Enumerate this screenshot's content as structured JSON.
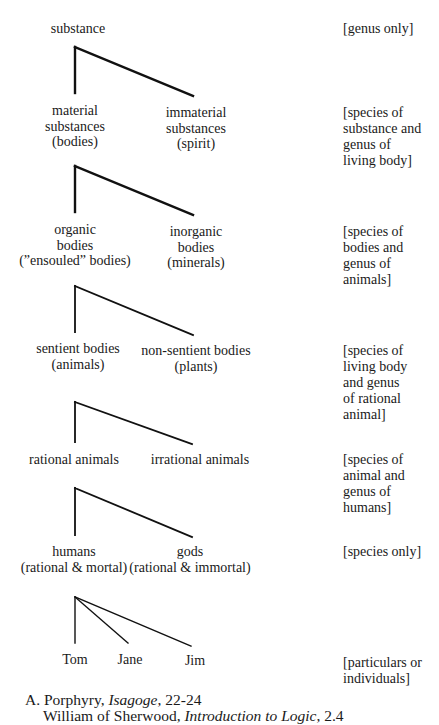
{
  "diagram": {
    "line_color": "#111111",
    "levels": [
      {
        "left": {
          "lines": [
            "substance"
          ]
        },
        "right": null,
        "note": [
          "[genus only]"
        ]
      },
      {
        "left": {
          "lines": [
            "material",
            "substances",
            "(bodies)"
          ]
        },
        "right": {
          "lines": [
            "immaterial",
            "substances",
            "(spirit)"
          ]
        },
        "note": [
          "[species of",
          "substance and",
          "genus of",
          "living body]"
        ]
      },
      {
        "left": {
          "lines": [
            "organic",
            "bodies",
            "(”ensouled” bodies)"
          ]
        },
        "right": {
          "lines": [
            "inorganic",
            "bodies",
            "(minerals)"
          ]
        },
        "note": [
          "[species of",
          "bodies and",
          "genus of",
          "animals]"
        ]
      },
      {
        "left": {
          "lines": [
            "sentient bodies",
            "(animals)"
          ]
        },
        "right": {
          "lines": [
            "non-sentient bodies",
            "(plants)"
          ]
        },
        "note": [
          "[species of",
          "living body",
          "and genus",
          "of rational",
          "animal]"
        ]
      },
      {
        "left": {
          "lines": [
            "rational animals"
          ]
        },
        "right": {
          "lines": [
            "irrational animals"
          ]
        },
        "note": [
          "[species of",
          "animal and",
          "genus of",
          "humans]"
        ]
      },
      {
        "left": {
          "lines": [
            "humans",
            "(rational & mortal)"
          ]
        },
        "right": {
          "lines": [
            "gods",
            "(rational & immortal)"
          ]
        },
        "note": [
          "[species only]"
        ]
      }
    ],
    "individuals": {
      "names": [
        "Tom",
        "Jane",
        "Jim"
      ],
      "note": [
        "[particulars or",
        "individuals]"
      ]
    },
    "connectors": [
      {
        "apex": [
          75,
          47
        ],
        "ends": [
          [
            75,
            93
          ],
          [
            193,
            96
          ]
        ]
      },
      {
        "apex": [
          75,
          166
        ],
        "ends": [
          [
            75,
            212
          ],
          [
            193,
            215
          ]
        ]
      },
      {
        "apex": [
          75,
          286
        ],
        "ends": [
          [
            75,
            332
          ],
          [
            193,
            335
          ]
        ]
      },
      {
        "apex": [
          75,
          402
        ],
        "ends": [
          [
            75,
            442
          ],
          [
            192,
            444
          ]
        ]
      },
      {
        "apex": [
          75,
          488
        ],
        "ends": [
          [
            75,
            535
          ],
          [
            192,
            537
          ]
        ]
      },
      {
        "apex": [
          75,
          597
        ],
        "ends": [
          [
            75,
            643
          ],
          [
            128,
            643
          ],
          [
            191,
            646
          ]
        ]
      }
    ]
  },
  "caption": {
    "line1": {
      "prefix": "A. Porphyry, ",
      "work": "Isagoge",
      "suffix": ", 22-24"
    },
    "line2": {
      "prefix": "William of Sherwood, ",
      "work": "Introduction to Logic",
      "suffix": ", 2.4"
    }
  }
}
